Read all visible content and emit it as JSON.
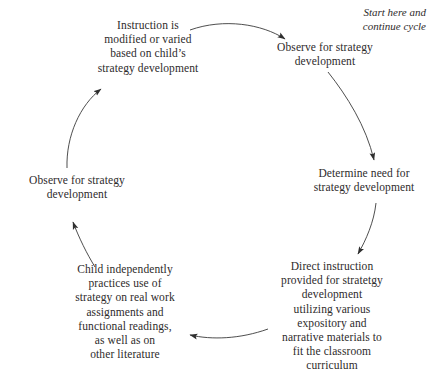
{
  "diagram": {
    "type": "cycle",
    "direction": "clockwise",
    "background_color": "#ffffff",
    "text_color": "#2e2b2b",
    "line_color": "#3a3a3a",
    "annotation": {
      "label": "Start here and\ncontinue cycle",
      "style": "italic"
    },
    "nodes": [
      {
        "id": "observe-top",
        "order": 1,
        "label": "Observe for strategy\ndevelopment"
      },
      {
        "id": "determine-need",
        "order": 2,
        "label": "Determine need for\nstrategy development"
      },
      {
        "id": "direct-instruction",
        "order": 3,
        "label": "Direct instruction\nprovided for stratetgy\ndevelopment\nutilizing various\nexpository and\nnarrative materials to\nfit the classroom\ncurriculum"
      },
      {
        "id": "child-practices",
        "order": 4,
        "label": "Child independently\npractices use of\nstrategy on real work\nassignments and\nfunctional readings,\nas well as on\nother literature"
      },
      {
        "id": "observe-left",
        "order": 5,
        "label": "Observe for strategy\ndevelopment"
      },
      {
        "id": "instruction-modified",
        "order": 6,
        "label": "Instruction is\nmodified or varied\nbased on child’s\nstrategy development"
      }
    ],
    "edges": [
      {
        "id": "edge-1",
        "from": "instruction-modified",
        "to": "observe-top"
      },
      {
        "id": "edge-2",
        "from": "observe-top",
        "to": "determine-need"
      },
      {
        "id": "edge-3",
        "from": "determine-need",
        "to": "direct-instruction"
      },
      {
        "id": "edge-4",
        "from": "direct-instruction",
        "to": "child-practices"
      },
      {
        "id": "edge-5",
        "from": "child-practices",
        "to": "observe-left"
      },
      {
        "id": "edge-6",
        "from": "observe-left",
        "to": "instruction-modified"
      }
    ]
  }
}
